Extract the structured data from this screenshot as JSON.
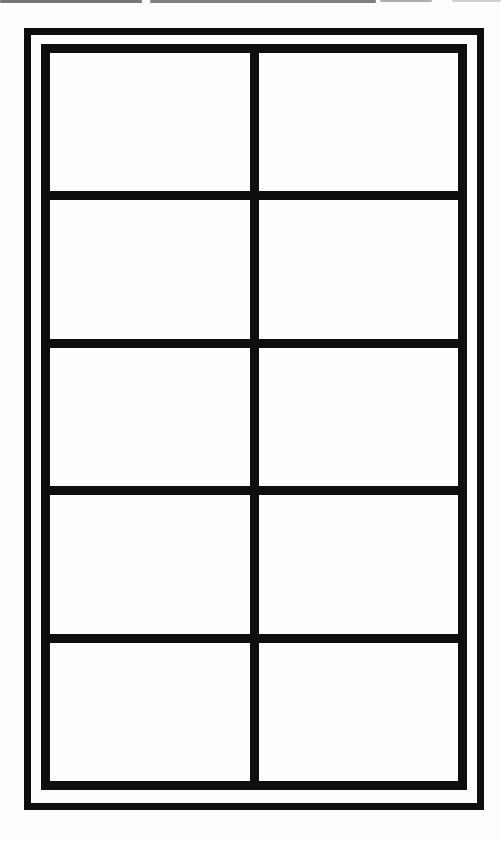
{
  "page": {
    "background_color": "#fdfdfd",
    "kind": "blank scanned worksheet grid"
  },
  "frame": {
    "line_color": "#0e0e0e",
    "gap_color": "#fdfdfd"
  },
  "scan_artifact": {
    "color": "#4a4a4a"
  },
  "grid": {
    "rows": 5,
    "columns": 2,
    "cell_background": "#fefefe",
    "cells": [
      {
        "row": 1,
        "col": 1,
        "content": ""
      },
      {
        "row": 1,
        "col": 2,
        "content": ""
      },
      {
        "row": 2,
        "col": 1,
        "content": ""
      },
      {
        "row": 2,
        "col": 2,
        "content": ""
      },
      {
        "row": 3,
        "col": 1,
        "content": ""
      },
      {
        "row": 3,
        "col": 2,
        "content": ""
      },
      {
        "row": 4,
        "col": 1,
        "content": ""
      },
      {
        "row": 4,
        "col": 2,
        "content": ""
      },
      {
        "row": 5,
        "col": 1,
        "content": ""
      },
      {
        "row": 5,
        "col": 2,
        "content": ""
      }
    ]
  }
}
